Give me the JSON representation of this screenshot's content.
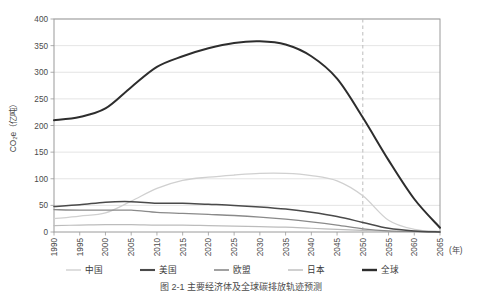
{
  "chart_data": {
    "type": "line",
    "title": "",
    "xlabel": "(年)",
    "ylabel": "CO₂e（亿吨）",
    "xlim": [
      1990,
      2065
    ],
    "ylim": [
      0,
      400
    ],
    "ytick_step": 50,
    "xtick_step": 5,
    "grid": true,
    "legend_position": "bottom",
    "x": [
      1990,
      1995,
      2000,
      2005,
      2010,
      2015,
      2020,
      2025,
      2030,
      2035,
      2040,
      2045,
      2050,
      2055,
      2060,
      2065
    ],
    "xticks": [
      "1990",
      "1995",
      "2000",
      "2005",
      "2010",
      "2015",
      "2020",
      "2025",
      "2030",
      "2035",
      "2040",
      "2045",
      "2050",
      "2055",
      "2060",
      "2065"
    ],
    "yticks": [
      "0",
      "50",
      "100",
      "150",
      "200",
      "250",
      "300",
      "350",
      "400"
    ],
    "annotations": [
      {
        "name": "net-zero-target-line",
        "type": "vline",
        "x": 2050,
        "style": "dashed"
      }
    ],
    "series": [
      {
        "name": "中国",
        "key": "china",
        "color": "#d0d0d0",
        "width": 1.3,
        "values": [
          25,
          30,
          36,
          58,
          82,
          97,
          103,
          107,
          110,
          110,
          106,
          96,
          68,
          22,
          5,
          1
        ]
      },
      {
        "name": "美国",
        "key": "usa",
        "color": "#4a4a4a",
        "width": 1.5,
        "values": [
          48,
          51,
          56,
          57,
          54,
          54,
          52,
          50,
          47,
          43,
          37,
          29,
          18,
          7,
          2,
          0
        ]
      },
      {
        "name": "欧盟",
        "key": "eu",
        "color": "#8a8a8a",
        "width": 1.3,
        "values": [
          42,
          41,
          41,
          41,
          37,
          35,
          33,
          31,
          28,
          24,
          19,
          13,
          6,
          2,
          1,
          0
        ]
      },
      {
        "name": "日本",
        "key": "japan",
        "color": "#bcbcbc",
        "width": 1.2,
        "values": [
          12,
          13,
          14,
          14,
          13,
          13,
          12,
          11,
          10,
          9,
          7,
          5,
          3,
          1,
          0,
          0
        ]
      },
      {
        "name": "全球",
        "key": "global",
        "color": "#2d2d2d",
        "width": 2.0,
        "values": [
          210,
          216,
          232,
          272,
          310,
          330,
          345,
          355,
          358,
          352,
          330,
          288,
          215,
          135,
          62,
          8
        ]
      }
    ]
  },
  "legend": {
    "items": [
      {
        "label": "中国",
        "color": "#d0d0d0",
        "width": 1.4
      },
      {
        "label": "美国",
        "color": "#4a4a4a",
        "width": 2.1
      },
      {
        "label": "欧盟",
        "color": "#8a8a8a",
        "width": 1.6
      },
      {
        "label": "日本",
        "color": "#bcbcbc",
        "width": 1.4
      },
      {
        "label": "全球",
        "color": "#2d2d2d",
        "width": 2.4
      }
    ]
  },
  "caption": {
    "text": "图 2-1  主要经济体及全球碳排放轨迹预测"
  }
}
